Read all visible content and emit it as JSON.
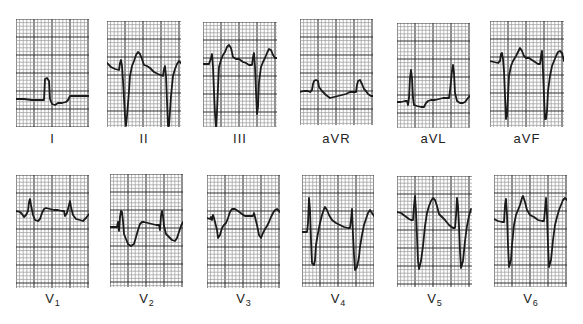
{
  "figure": {
    "grid": {
      "small_px": 3.6,
      "major_every": 5,
      "minor_color": "#9a9a9a",
      "major_color": "#333333"
    },
    "trace_color": "#1a1a1a"
  },
  "leads": [
    {
      "id": "I",
      "label": "I",
      "sub": "",
      "x": 16,
      "y": 19,
      "w": 73,
      "h": 108,
      "label_y": 131,
      "path": "M0,80 L8,80 L16,81 L24,81 L28,81 L29,60 L31,59 L33,62 L34,80 L36,85 L39,86 L42,84 L46,84 L50,83 L52,81 L54,77 L58,77 L66,77 L72,77 L74,77 L76,75 L77,57 L79,57 L80,75 L82,80 L85,81 L88,80 L90,80"
    },
    {
      "id": "II",
      "label": "II",
      "sub": "",
      "x": 107,
      "y": 21,
      "w": 74,
      "h": 106,
      "label_y": 131,
      "path": "M0,42 L4,46 L8,48 L12,49 L13,42 L14,39 L15,45 L16,60 L18,95 L19,105 L20,95 L22,70 L23,55 L25,45 L27,40 L29,34 L31,31 L33,33 L35,38 L37,44 L40,45 L43,47 L47,51 L51,53 L56,55 L57,48 L58,45 L59,55 L60,80 L61,105 L62,105 L63,90 L64,75 L66,55 L68,48 L70,43 L72,40 L74,42"
    },
    {
      "id": "III",
      "label": "III",
      "sub": "",
      "x": 203,
      "y": 22,
      "w": 74,
      "h": 105,
      "label_y": 131,
      "path": "M0,42 L4,42 L6,42 L8,36 L9,32 L10,45 L11,70 L12,92 L13,105 L14,90 L15,65 L16,45 L18,38 L20,33 L22,30 L24,25 L26,23 L28,26 L30,35 L33,37 L36,37 L40,40 L43,41 L46,43 L49,43 L50,35 L51,31 L52,45 L53,70 L54,92 L55,85 L56,60 L58,45 L60,40 L62,36 L64,31 L66,27 L68,28 L70,33 L72,36 L74,36"
    },
    {
      "id": "aVR",
      "label": "aVR",
      "sub": "",
      "x": 300,
      "y": 19,
      "w": 73,
      "h": 106,
      "label_y": 131,
      "path": "M0,73 L4,72 L8,72 L10,73 L12,71 L13,65 L14,62 L16,61 L18,62 L19,68 L22,72 L26,76 L30,79 L34,78 L38,77 L42,76 L46,75 L50,73 L54,73 L56,73 L57,66 L58,62 L60,61 L62,65 L64,70 L66,72 L68,75 L71,77 L73,77"
    },
    {
      "id": "aVL",
      "label": "aVL",
      "sub": "",
      "x": 397,
      "y": 23,
      "w": 73,
      "h": 105,
      "label_y": 131,
      "path": "M0,79 L4,79 L8,78 L10,78 L11,82 L12,75 L13,55 L14,47 L15,55 L16,75 L17,82 L20,83 L24,84 L27,84 L29,80 L31,78 L34,77 L38,77 L42,76 L46,75 L50,75 L52,75 L53,68 L55,48 L56,42 L57,50 L58,70 L60,78 L63,80 L66,80 L68,79 L71,75 L73,73"
    },
    {
      "id": "aVF",
      "label": "aVF",
      "sub": "",
      "x": 490,
      "y": 21,
      "w": 74,
      "h": 106,
      "label_y": 131,
      "path": "M0,40 L4,41 L8,42 L10,40 L11,33 L12,32 L13,38 L14,50 L15,75 L16,98 L17,95 L18,75 L19,55 L21,45 L23,40 L26,35 L28,31 L30,27 L32,30 L34,35 L36,37 L39,37 L42,39 L45,41 L48,43 L50,43 L51,35 L52,30 L53,50 L54,75 L55,98 L56,98 L57,90 L58,70 L60,55 L62,45 L64,40 L66,35 L68,31 L70,30 L72,32 L74,40"
    },
    {
      "id": "V1",
      "label": "V",
      "sub": "1",
      "x": 16,
      "y": 175,
      "w": 73,
      "h": 113,
      "label_y": 291,
      "path": "M0,36 L4,37 L6,39 L8,42 L10,40 L12,36 L13,27 L14,24 L15,30 L17,40 L19,45 L22,46 L24,44 L26,38 L28,34 L30,33 L34,34 L38,35 L42,35 L46,36 L48,36 L49,41 L51,38 L53,30 L54,26 L55,32 L57,40 L60,44 L64,45 L67,46 L70,43 L73,39"
    },
    {
      "id": "V2",
      "label": "V",
      "sub": "2",
      "x": 110,
      "y": 174,
      "w": 73,
      "h": 113,
      "label_y": 291,
      "path": "M0,53 L4,53 L7,53 L8,48 L9,57 L10,43 L11,37 L12,38 L13,47 L14,60 L16,65 L18,70 L21,72 L24,70 L26,63 L28,56 L30,50 L32,48 L34,48 L38,49 L42,50 L46,51 L49,51 L50,56 L51,42 L52,37 L53,42 L54,52 L56,60 L58,62 L60,64 L62,66 L65,67 L67,64 L69,58 L71,52 L73,48"
    },
    {
      "id": "V3",
      "label": "V",
      "sub": "3",
      "x": 207,
      "y": 175,
      "w": 73,
      "h": 113,
      "label_y": 291,
      "path": "M0,43 L3,44 L4,42 L5,45 L6,40 L7,43 L8,47 L10,55 L11,63 L13,60 L15,53 L17,50 L19,48 L21,43 L23,37 L25,34 L28,34 L31,36 L35,39 L38,41 L42,41 L46,41 L47,38 L48,42 L50,50 L52,60 L54,63 L56,58 L58,54 L60,51 L62,47 L64,42 L66,38 L68,35 L70,34 L73,37"
    },
    {
      "id": "V4",
      "label": "V",
      "sub": "4",
      "x": 302,
      "y": 175,
      "w": 72,
      "h": 112,
      "label_y": 291,
      "path": "M0,57 L3,57 L5,57 L6,48 L7,23 L8,35 L9,65 L10,88 L12,90 L13,85 L14,70 L16,58 L18,48 L20,40 L22,34 L23,32 L25,35 L27,40 L30,45 L34,48 L38,50 L42,52 L46,53 L48,53 L49,45 L50,34 L51,60 L52,80 L53,95 L55,92 L57,82 L58,72 L60,60 L62,50 L64,44 L66,38 L68,35 L70,38 L72,41"
    },
    {
      "id": "V5",
      "label": "V",
      "sub": "5",
      "x": 397,
      "y": 176,
      "w": 75,
      "h": 111,
      "label_y": 291,
      "path": "M0,36 L4,37 L8,40 L12,43 L14,44 L16,44 L17,30 L18,20 L19,35 L20,60 L21,85 L22,93 L24,85 L26,70 L28,50 L30,37 L32,30 L34,25 L36,22 L38,24 L40,30 L42,38 L45,41 L48,44 L52,49 L56,52 L58,52 L59,40 L60,22 L61,30 L62,50 L63,75 L64,92 L66,85 L68,65 L70,50 L72,40 L74,33"
    },
    {
      "id": "V6",
      "label": "V",
      "sub": "6",
      "x": 494,
      "y": 175,
      "w": 73,
      "h": 112,
      "label_y": 291,
      "path": "M0,44 L4,46 L8,47 L10,47 L11,30 L12,24 L13,40 L14,70 L15,92 L17,85 L18,70 L20,50 L22,40 L24,35 L26,30 L28,23 L29,21 L31,27 L33,35 L36,40 L40,42 L44,45 L48,46 L50,46 L51,35 L52,23 L53,40 L54,70 L55,92 L57,85 L59,65 L61,50 L63,42 L65,35 L67,30 L69,25 L71,23 L73,25"
    }
  ]
}
